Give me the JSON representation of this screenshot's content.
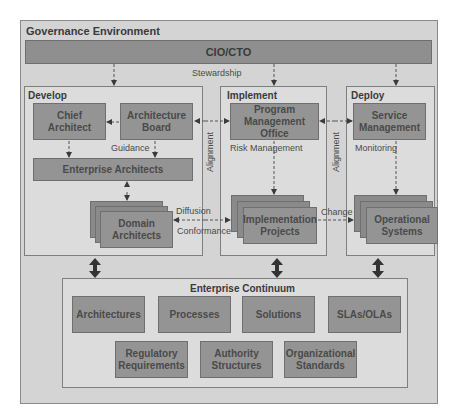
{
  "governance": {
    "title": "Governance Environment",
    "cio_bar": "CIO/CTO",
    "stewardship_label": "Stewardship"
  },
  "develop": {
    "title": "Develop",
    "chief_architect": "Chief\nArchitect",
    "architecture_board": "Architecture\nBoard",
    "guidance_label": "Guidance",
    "enterprise_architects": "Enterprise Architects",
    "domain_architects": "Domain\nArchitects"
  },
  "implement": {
    "title": "Implement",
    "pmo": "Program\nManagement Office",
    "risk_label": "Risk Management",
    "implementation_projects": "Implementation\nProjects"
  },
  "deploy": {
    "title": "Deploy",
    "service_management": "Service\nManagement",
    "monitoring_label": "Monitoring",
    "operational_systems": "Operational\nSystems"
  },
  "connectors": {
    "alignment_left": "Alignment",
    "alignment_right": "Alignment",
    "diffusion": "Diffusion",
    "conformance": "Conformance",
    "change": "Change"
  },
  "continuum": {
    "title": "Enterprise Continuum",
    "row1": [
      "Architectures",
      "Processes",
      "Solutions",
      "SLAs/OLAs"
    ],
    "row2": [
      "Regulatory\nRequirements",
      "Authority\nStructures",
      "Organizational\nStandards"
    ]
  },
  "colors": {
    "background": "#d4d4d4",
    "panel": "#dcdcdc",
    "box_fill": "#949494",
    "cio_bar": "#8f8f8f",
    "border": "#7f7f7f",
    "text": "#3a3a3a"
  }
}
